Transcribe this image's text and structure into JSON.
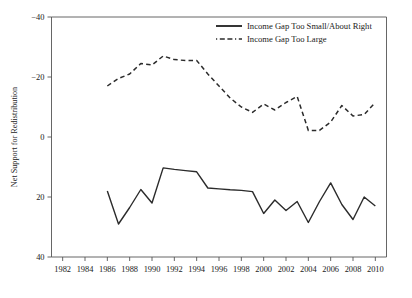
{
  "chart_data": {
    "type": "line",
    "title": "",
    "xlabel": "",
    "ylabel": "Net Support for Redistribution",
    "xlim": [
      1981,
      2011
    ],
    "ylim": [
      -40,
      40
    ],
    "grid": false,
    "legend_position": "top-right",
    "xticks": [
      1982,
      1984,
      1986,
      1988,
      1990,
      1992,
      1994,
      1996,
      1998,
      2000,
      2002,
      2004,
      2006,
      2008,
      2010
    ],
    "yticks": [
      -40,
      -20,
      0,
      20,
      40
    ],
    "x": [
      1986,
      1987,
      1988,
      1989,
      1990,
      1991,
      1992,
      1993,
      1994,
      1995,
      1996,
      1997,
      1998,
      1999,
      2000,
      2001,
      2002,
      2003,
      2004,
      2005,
      2006,
      2007,
      2008,
      2009,
      2010
    ],
    "series": [
      {
        "name": "Income Gap Too Small/About Right",
        "style": "solid",
        "color": "#2b2b2b",
        "values": [
          -18.0,
          -29.0,
          -23.5,
          -17.5,
          -22.0,
          -10.3,
          -10.8,
          -11.2,
          -11.6,
          -17.0,
          -17.3,
          -17.6,
          -17.8,
          -18.2,
          -25.5,
          -21.0,
          -24.5,
          -21.5,
          -28.5,
          -21.5,
          -15.3,
          -22.5,
          -27.5,
          -20.0,
          -23.0
        ]
      },
      {
        "name": "Income Gap Too Large",
        "style": "dashed",
        "color": "#2b2b2b",
        "values": [
          17.0,
          19.5,
          21.0,
          24.5,
          24.0,
          27.0,
          25.8,
          25.5,
          25.5,
          21.0,
          17.0,
          13.0,
          10.0,
          8.2,
          11.0,
          9.0,
          11.5,
          13.5,
          2.2,
          2.2,
          5.0,
          10.5,
          7.0,
          7.5,
          11.5
        ]
      }
    ]
  },
  "legend": {
    "items": [
      {
        "label": "Income Gap Too Small/About Right",
        "style": "solid"
      },
      {
        "label": "Income Gap Too Large",
        "style": "dashed"
      }
    ]
  },
  "axis": {
    "y_title": "Net Support for Redistribution",
    "y_tick_labels": [
      "40",
      "20",
      "0",
      "−20",
      "−40"
    ],
    "x_tick_labels": [
      "1982",
      "1984",
      "1986",
      "1988",
      "1990",
      "1992",
      "1994",
      "1996",
      "1998",
      "2000",
      "2002",
      "2004",
      "2006",
      "2008",
      "2010"
    ]
  },
  "colors": {
    "line": "#2b2b2b",
    "axis": "#555555",
    "text": "#1a1a1a",
    "background": "#ffffff"
  }
}
